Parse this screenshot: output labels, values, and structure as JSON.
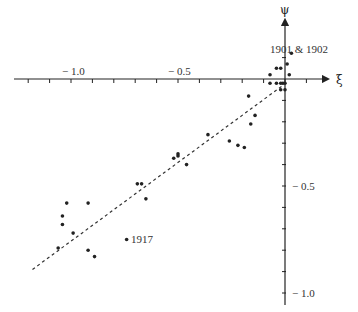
{
  "chart_data": {
    "type": "scatter",
    "title": "",
    "xlabel": "ξ",
    "ylabel": "ψ",
    "xlim": [
      -1.3,
      0.3
    ],
    "ylim": [
      -1.1,
      0.35
    ],
    "grid": false,
    "legend": null,
    "x_ticks": [
      -1.2,
      -1.1,
      -1.0,
      -0.9,
      -0.8,
      -0.7,
      -0.6,
      -0.5,
      -0.4,
      -0.3,
      -0.2,
      -0.1,
      0.0,
      0.1
    ],
    "x_tick_labels": [
      {
        "value": -1.0,
        "text": "− 1.0"
      },
      {
        "value": -0.5,
        "text": "− 0.5"
      }
    ],
    "y_ticks": [
      0.1,
      -0.1,
      -0.2,
      -0.3,
      -0.4,
      -0.5,
      -0.6,
      -0.7,
      -0.8,
      -0.9,
      -1.0
    ],
    "y_tick_labels": [
      {
        "value": -0.5,
        "text": "− 0.5"
      },
      {
        "value": -1.0,
        "text": "− 1.0"
      }
    ],
    "series": [
      {
        "name": "observations",
        "marker": "dot",
        "points": [
          {
            "x": 0.03,
            "y": 0.12
          },
          {
            "x": 0.01,
            "y": 0.07
          },
          {
            "x": 0.02,
            "y": 0.02
          },
          {
            "x": -0.07,
            "y": 0.02
          },
          {
            "x": -0.04,
            "y": 0.05
          },
          {
            "x": -0.02,
            "y": 0.05
          },
          {
            "x": -0.07,
            "y": -0.02
          },
          {
            "x": -0.04,
            "y": -0.02
          },
          {
            "x": -0.02,
            "y": -0.02
          },
          {
            "x": -0.01,
            "y": -0.02
          },
          {
            "x": 0.0,
            "y": -0.02
          },
          {
            "x": -0.02,
            "y": -0.05
          },
          {
            "x": 0.0,
            "y": -0.05
          },
          {
            "x": -0.17,
            "y": -0.08
          },
          {
            "x": -0.14,
            "y": -0.17
          },
          {
            "x": -0.16,
            "y": -0.21
          },
          {
            "x": -0.36,
            "y": -0.26
          },
          {
            "x": -0.26,
            "y": -0.29
          },
          {
            "x": -0.22,
            "y": -0.31
          },
          {
            "x": -0.19,
            "y": -0.32
          },
          {
            "x": -0.52,
            "y": -0.37
          },
          {
            "x": -0.5,
            "y": -0.36
          },
          {
            "x": -0.5,
            "y": -0.35
          },
          {
            "x": -0.46,
            "y": -0.4
          },
          {
            "x": -0.69,
            "y": -0.49
          },
          {
            "x": -0.67,
            "y": -0.49
          },
          {
            "x": -0.65,
            "y": -0.56
          },
          {
            "x": -1.02,
            "y": -0.58
          },
          {
            "x": -0.92,
            "y": -0.58
          },
          {
            "x": -1.04,
            "y": -0.64
          },
          {
            "x": -1.04,
            "y": -0.68
          },
          {
            "x": -0.99,
            "y": -0.72
          },
          {
            "x": -1.06,
            "y": -0.79
          },
          {
            "x": -0.92,
            "y": -0.8
          },
          {
            "x": -0.89,
            "y": -0.83
          },
          {
            "x": -0.74,
            "y": -0.75,
            "label": "1917"
          }
        ]
      },
      {
        "name": "fit",
        "type": "line",
        "style": "dashed",
        "points": [
          {
            "x": -1.18,
            "y": -0.89
          },
          {
            "x": -0.01,
            "y": -0.03
          }
        ]
      }
    ],
    "annotations": [
      {
        "text": "1901 & 1902",
        "x": 0.0,
        "y": 0.17
      },
      {
        "text": "1917",
        "x": -0.74,
        "y": -0.75
      }
    ]
  },
  "labels": {
    "x_axis": "ξ",
    "y_axis": "ψ",
    "annotation_1901": "1901 & 1902",
    "annotation_1917": "1917",
    "x_tick_m10": "− 1.0",
    "x_tick_m05": "− 0.5",
    "y_tick_m05": "− 0.5",
    "y_tick_m10": "− 1.0"
  },
  "colors": {
    "ink": "#222222",
    "background": "#ffffff"
  }
}
